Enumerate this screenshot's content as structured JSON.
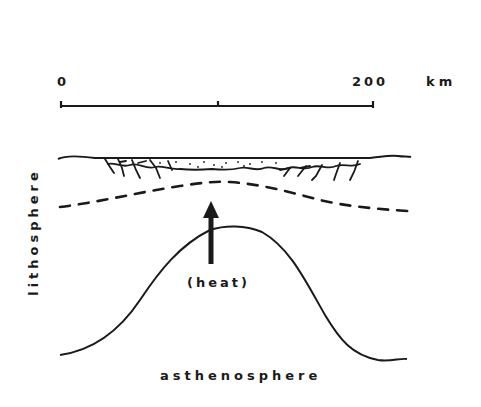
{
  "diagram": {
    "type": "geologic-cross-section",
    "scale_bar": {
      "start_label": "0",
      "end_label": "200",
      "unit": "km",
      "midpoint_tick": true
    },
    "labels": {
      "side_layer": "lithosphere",
      "bottom_layer": "asthenosphere",
      "arrow_annotation": "(heat)"
    },
    "features": [
      {
        "name": "surface-line",
        "style": "solid"
      },
      {
        "name": "rift-basin-sediments",
        "style": "stippled with normal faults"
      },
      {
        "name": "crust-mantle-boundary",
        "style": "dashed, arched upward"
      },
      {
        "name": "lithosphere-asthenosphere-boundary",
        "style": "solid bell-shaped upwelling"
      },
      {
        "name": "heat-arrow",
        "direction": "up"
      }
    ],
    "colors": {
      "ink": "#1a1a1a",
      "background": "#ffffff"
    }
  }
}
